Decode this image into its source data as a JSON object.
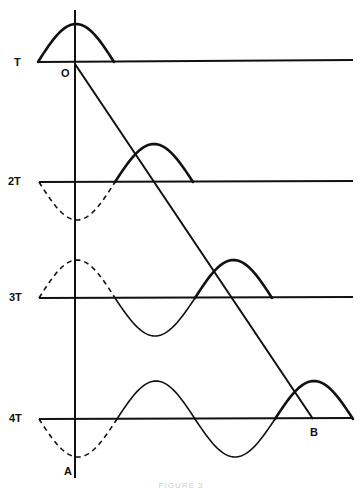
{
  "figure": {
    "stroke_color": "#111111",
    "background": "#ffffff",
    "caption": "FIGURE 3",
    "axis": {
      "x": 75,
      "y_top": 10,
      "y_bottom": 478
    },
    "diagonal": {
      "from": [
        75,
        64
      ],
      "to": [
        313,
        419
      ]
    },
    "quarter_wave_px": 39,
    "amplitude_px": 38,
    "rows": [
      {
        "label": "T",
        "label_pos": [
          14,
          57
        ],
        "baseline_y": 62,
        "line_x": [
          38,
          353
        ],
        "segments": [
          {
            "style": "thick",
            "from_x": 38,
            "to_x": 114,
            "sign": 1
          }
        ]
      },
      {
        "label": "2T",
        "label_pos": [
          8,
          176
        ],
        "baseline_y": 182,
        "line_x": [
          39,
          353
        ],
        "segments": [
          {
            "style": "dashed",
            "from_x": 39,
            "to_x": 115,
            "sign": -1
          },
          {
            "style": "thick",
            "from_x": 115,
            "to_x": 193,
            "sign": 1
          }
        ]
      },
      {
        "label": "3T",
        "label_pos": [
          9,
          292
        ],
        "baseline_y": 298,
        "line_x": [
          39,
          353
        ],
        "segments": [
          {
            "style": "dashed",
            "from_x": 39,
            "to_x": 115,
            "sign": 1
          },
          {
            "style": "thin",
            "from_x": 115,
            "to_x": 195,
            "sign": -1
          },
          {
            "style": "thick",
            "from_x": 195,
            "to_x": 272,
            "sign": 1
          }
        ]
      },
      {
        "label": "4T",
        "label_pos": [
          9,
          413
        ],
        "baseline_y": 419,
        "line_x": [
          39,
          353
        ],
        "segments": [
          {
            "style": "dashed",
            "from_x": 39,
            "to_x": 117,
            "sign": -1
          },
          {
            "style": "thin",
            "from_x": 117,
            "to_x": 195,
            "sign": 1
          },
          {
            "style": "thin",
            "from_x": 195,
            "to_x": 275,
            "sign": -1
          },
          {
            "style": "thick",
            "from_x": 275,
            "to_x": 353,
            "sign": 1
          }
        ]
      }
    ],
    "points": [
      {
        "label": "O",
        "pos": [
          61,
          68
        ]
      },
      {
        "label": "A",
        "pos": [
          64,
          466
        ]
      },
      {
        "label": "B",
        "pos": [
          310,
          427
        ]
      }
    ]
  }
}
